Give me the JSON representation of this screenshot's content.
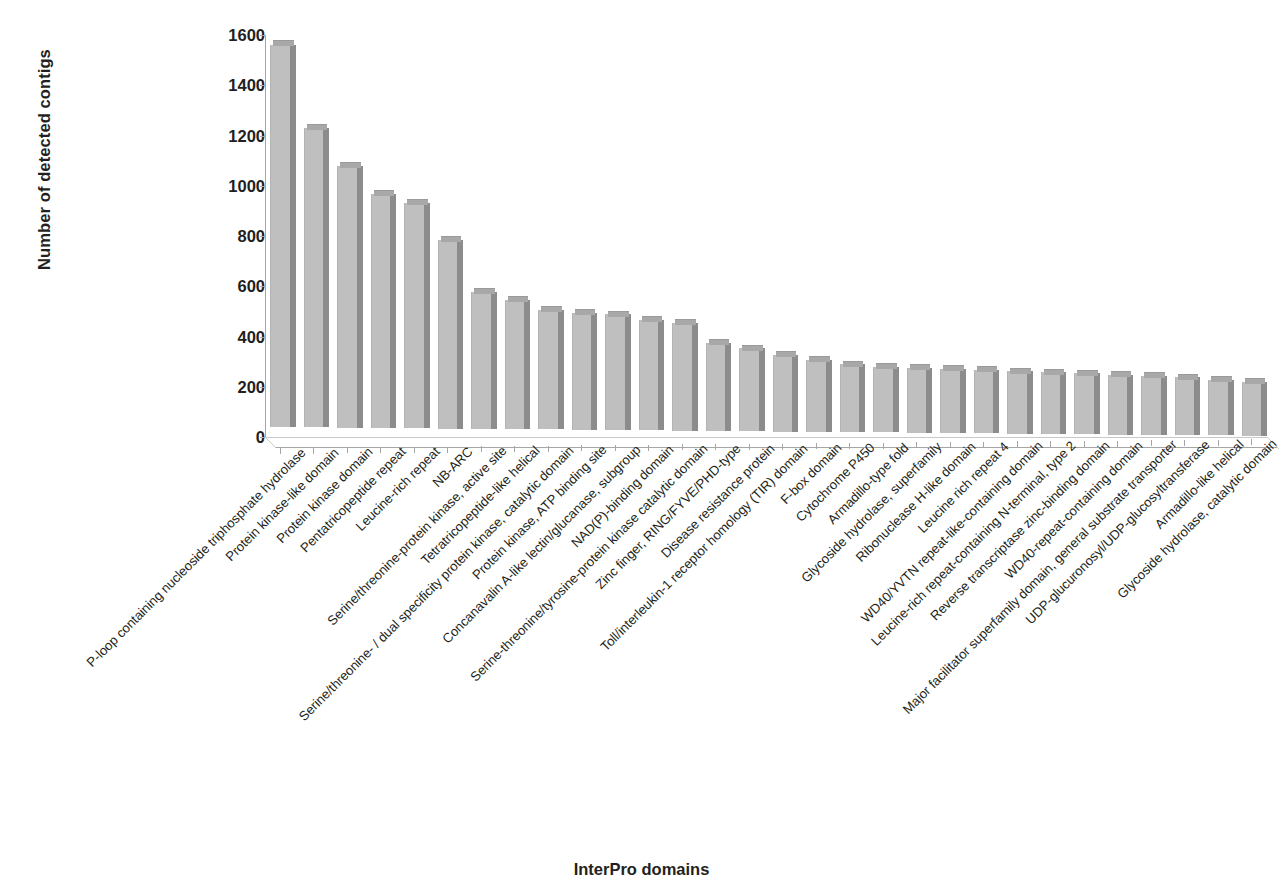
{
  "chart_data": {
    "type": "bar",
    "title": "",
    "xlabel": "InterPro domains",
    "ylabel": "Number of detected contigs",
    "ylim": [
      0,
      1600
    ],
    "yticks": [
      0,
      200,
      400,
      600,
      800,
      1000,
      1200,
      1400,
      1600
    ],
    "grid": false,
    "legend": null,
    "bar_color": "#bfbfbf",
    "bar_side_color": "#8c8c8c",
    "bar_top_color": "#a8a8a8",
    "categories": [
      "P-loop containing nucleoside triphosphate hydrolase",
      "Protein kinase-like domain",
      "Protein kinase domain",
      "Pentatricopeptide repeat",
      "Leucine-rich repeat",
      "NB-ARC",
      "Serine/threonine-protein kinase, active site",
      "Tetratricopeptide-like helical",
      "Serine/threonine- / dual specificity protein kinase, catalytic domain",
      "Protein kinase, ATP binding site",
      "Concanavalin A-like lectin/glucanase, subgroup",
      "NAD(P)-binding domain",
      "Serine-threonine/tyrosine-protein kinase catalytic domain",
      "Zinc finger, RING/FYVE/PHD-type",
      "Disease resistance protein",
      "Toll/interleukin-1 receptor homology (TIR) domain",
      "F-box domain",
      "Cytochrome P450",
      "Armadillo-type fold",
      "Glycoside hydrolase, superfamily",
      "Ribonuclease H-like domain",
      "Leucine rich repeat 4",
      "WD40/YVTN repeat-like-containing domain",
      "Leucine-rich repeat-containing N-terminal, type 2",
      "Reverse transcriptase zinc-binding domain",
      "WD40-repeat-containing domain",
      "Major facilitator superfamily domain, general substrate transporter",
      "UDP-glucuronosyl/UDP-glucosyltransferase",
      "Armadillo-like helical",
      "Glycoside hydrolase, catalytic domain"
    ],
    "values": [
      1520,
      1190,
      1040,
      930,
      895,
      750,
      545,
      515,
      475,
      465,
      460,
      440,
      430,
      350,
      330,
      305,
      285,
      270,
      262,
      258,
      255,
      252,
      248,
      245,
      242,
      238,
      235,
      230,
      222,
      215
    ],
    "value_tops": [
      1540,
      1208,
      1056,
      948,
      912,
      766,
      560,
      530,
      490,
      480,
      474,
      455,
      444,
      365,
      345,
      320,
      300,
      285,
      277,
      273,
      270,
      267,
      263,
      260,
      257,
      253,
      250,
      245,
      237,
      230
    ]
  },
  "axes": {
    "y_title": "Number of detected contigs",
    "x_title": "InterPro domains",
    "y_tick_labels": [
      "0",
      "200",
      "400",
      "600",
      "800",
      "1000",
      "1200",
      "1400",
      "1600"
    ]
  }
}
